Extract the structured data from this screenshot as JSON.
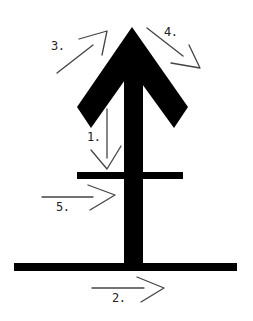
{
  "diagram": {
    "colors": {
      "background": "#ffffff",
      "glyph": "#000000",
      "guide": "#444444",
      "label": "#222222"
    },
    "glyph": {
      "description": "Upward arrow with a crossbar and a base line",
      "arrowhead": {
        "apex": [
          132,
          27
        ],
        "left_outer": [
          77,
          107
        ],
        "left_inner": [
          91,
          128
        ],
        "right_outer": [
          188,
          107
        ],
        "right_inner": [
          174,
          128
        ]
      },
      "stem": {
        "x": 124,
        "width": 19,
        "top": 60,
        "bottom": 265
      },
      "crossbar": {
        "x1": 77,
        "x2": 183,
        "y": 172,
        "height": 7
      },
      "baseline": {
        "x1": 14,
        "x2": 237,
        "y": 263,
        "height": 8
      }
    },
    "strokes": [
      {
        "order": 1,
        "label": "1.",
        "direction": "down",
        "label_pos": [
          87,
          131
        ]
      },
      {
        "order": 2,
        "label": "2.",
        "direction": "right",
        "label_pos": [
          112,
          292
        ]
      },
      {
        "order": 3,
        "label": "3.",
        "direction": "up-right",
        "label_pos": [
          51,
          40
        ]
      },
      {
        "order": 4,
        "label": "4.",
        "direction": "down-right",
        "label_pos": [
          164,
          26
        ]
      },
      {
        "order": 5,
        "label": "5.",
        "direction": "right",
        "label_pos": [
          56,
          201
        ]
      }
    ]
  }
}
